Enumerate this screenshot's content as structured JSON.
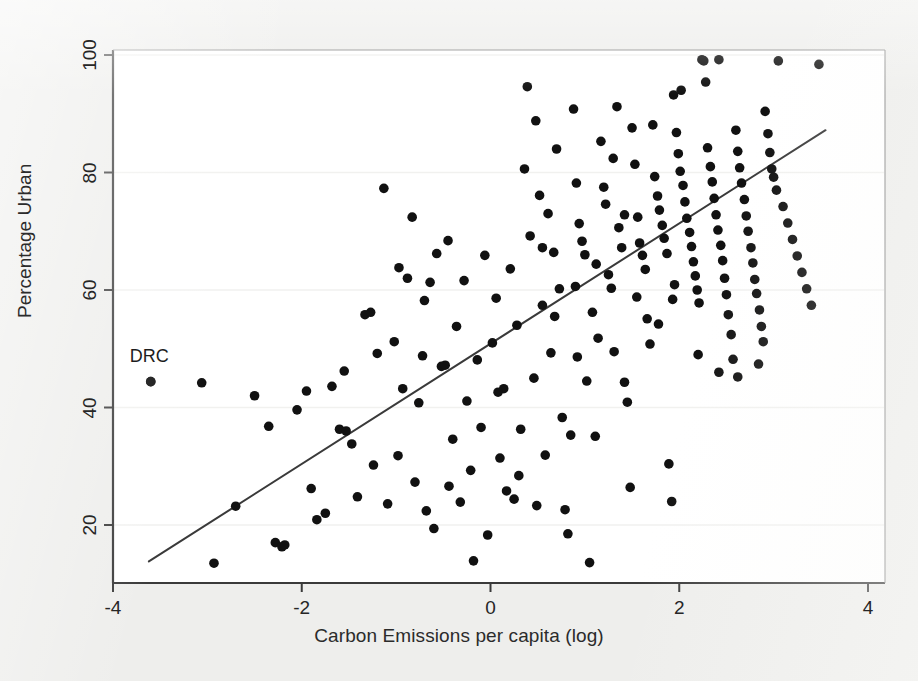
{
  "figure": {
    "background_color": "#eeeeec",
    "plot_background_color": "#ffffff",
    "width": 918,
    "height": 681
  },
  "axes": {
    "x": {
      "title": "Carbon Emissions per capita (log)",
      "ticks": [
        -4,
        -2,
        0,
        2,
        4
      ],
      "tick_labels": [
        "-4",
        "-2",
        "0",
        "2",
        "4"
      ],
      "range": [
        -4.2,
        4.2
      ],
      "pixel_left": 113,
      "pixel_right": 885,
      "px_at_minus4": 113,
      "px_at_plus4": 868
    },
    "y": {
      "title": "Percentage Urban",
      "ticks": [
        20,
        40,
        60,
        80,
        100
      ],
      "tick_labels": [
        "20",
        "40",
        "60",
        "80",
        "100"
      ],
      "range": [
        10,
        104
      ],
      "pixel_top": 50,
      "pixel_bottom": 583,
      "px_at_100": 55,
      "px_at_20": 525
    },
    "grid": "horizontal-faint",
    "grid_color": "#f1f1ef",
    "frame_color": "#3a3a3a"
  },
  "annotations": [
    {
      "text": "DRC",
      "x": -3.6,
      "y": 48.5,
      "point_x": -3.6,
      "point_y": 44.4
    }
  ],
  "marker": {
    "color": "#111111",
    "radius_px": 4.8,
    "shape": "circle"
  },
  "chart_data": {
    "type": "scatter",
    "title": "",
    "subtitle": "",
    "xlabel": "Carbon Emissions per capita (log)",
    "ylabel": "Percentage Urban",
    "xlim": [
      -4.2,
      4.2
    ],
    "ylim": [
      10,
      104
    ],
    "xticks": [
      -4,
      -2,
      0,
      2,
      4
    ],
    "yticks": [
      20,
      40,
      60,
      80,
      100
    ],
    "grid": "horizontal",
    "legend": null,
    "n_points": 186,
    "fit_line": {
      "type": "linear",
      "label": "",
      "x_start": -3.62,
      "y_start": 13.8,
      "x_end": 3.55,
      "y_end": 87.2,
      "slope": 10.24,
      "intercept": 50.86,
      "color": "#3a3a3a",
      "width_px": 2.0
    },
    "points": [
      [
        -3.6,
        44.4
      ],
      [
        -3.06,
        44.2
      ],
      [
        -2.93,
        13.5
      ],
      [
        -2.7,
        23.2
      ],
      [
        -2.5,
        42.0
      ],
      [
        -2.35,
        36.8
      ],
      [
        -2.28,
        17.0
      ],
      [
        -2.21,
        16.3
      ],
      [
        -2.18,
        16.6
      ],
      [
        -1.95,
        42.8
      ],
      [
        -1.9,
        26.2
      ],
      [
        -1.84,
        20.9
      ],
      [
        -1.68,
        43.6
      ],
      [
        -1.6,
        36.3
      ],
      [
        -1.53,
        36.0
      ],
      [
        -1.47,
        33.8
      ],
      [
        -1.41,
        24.8
      ],
      [
        -1.33,
        55.8
      ],
      [
        -1.27,
        56.2
      ],
      [
        -1.24,
        30.2
      ],
      [
        -1.2,
        49.2
      ],
      [
        -1.13,
        77.3
      ],
      [
        -1.09,
        23.6
      ],
      [
        -1.02,
        51.2
      ],
      [
        -0.97,
        63.8
      ],
      [
        -0.93,
        43.2
      ],
      [
        -0.88,
        62.0
      ],
      [
        -0.83,
        72.4
      ],
      [
        -0.8,
        27.3
      ],
      [
        -0.76,
        40.8
      ],
      [
        -0.72,
        48.8
      ],
      [
        -0.68,
        22.4
      ],
      [
        -0.64,
        61.3
      ],
      [
        -0.6,
        19.4
      ],
      [
        -0.57,
        66.2
      ],
      [
        -0.52,
        47.0
      ],
      [
        -0.48,
        47.2
      ],
      [
        -0.44,
        26.6
      ],
      [
        -0.4,
        34.6
      ],
      [
        -0.36,
        53.8
      ],
      [
        -0.32,
        23.9
      ],
      [
        -0.28,
        61.6
      ],
      [
        -0.25,
        41.1
      ],
      [
        -0.21,
        29.3
      ],
      [
        -0.18,
        13.9
      ],
      [
        -0.14,
        48.1
      ],
      [
        -0.1,
        36.6
      ],
      [
        -0.06,
        65.9
      ],
      [
        -0.03,
        18.3
      ],
      [
        0.02,
        51.0
      ],
      [
        0.06,
        58.6
      ],
      [
        0.1,
        31.4
      ],
      [
        0.14,
        43.2
      ],
      [
        0.17,
        25.8
      ],
      [
        0.21,
        63.6
      ],
      [
        0.25,
        24.4
      ],
      [
        0.28,
        54.0
      ],
      [
        0.32,
        36.3
      ],
      [
        0.36,
        80.6
      ],
      [
        0.39,
        94.6
      ],
      [
        0.42,
        69.2
      ],
      [
        0.46,
        45.0
      ],
      [
        0.49,
        23.3
      ],
      [
        0.52,
        76.1
      ],
      [
        0.55,
        57.4
      ],
      [
        0.58,
        31.9
      ],
      [
        0.61,
        73.0
      ],
      [
        0.64,
        49.3
      ],
      [
        0.67,
        66.4
      ],
      [
        0.7,
        84.0
      ],
      [
        0.73,
        60.2
      ],
      [
        0.76,
        38.3
      ],
      [
        0.79,
        22.6
      ],
      [
        0.82,
        18.5
      ],
      [
        0.85,
        35.3
      ],
      [
        0.88,
        90.8
      ],
      [
        0.91,
        78.2
      ],
      [
        0.94,
        71.3
      ],
      [
        0.97,
        68.3
      ],
      [
        1.0,
        66.0
      ],
      [
        1.02,
        44.5
      ],
      [
        1.05,
        13.6
      ],
      [
        1.08,
        56.2
      ],
      [
        1.11,
        35.1
      ],
      [
        1.14,
        51.8
      ],
      [
        1.17,
        85.3
      ],
      [
        1.2,
        77.5
      ],
      [
        1.22,
        74.6
      ],
      [
        1.25,
        62.6
      ],
      [
        1.28,
        60.3
      ],
      [
        1.31,
        49.5
      ],
      [
        1.34,
        91.2
      ],
      [
        1.36,
        70.6
      ],
      [
        1.39,
        67.2
      ],
      [
        1.42,
        44.3
      ],
      [
        1.45,
        40.9
      ],
      [
        1.48,
        26.4
      ],
      [
        1.5,
        87.6
      ],
      [
        1.53,
        81.4
      ],
      [
        1.56,
        72.4
      ],
      [
        1.58,
        68.0
      ],
      [
        1.61,
        65.9
      ],
      [
        1.64,
        63.5
      ],
      [
        1.66,
        55.1
      ],
      [
        1.69,
        50.8
      ],
      [
        1.72,
        88.1
      ],
      [
        1.74,
        79.3
      ],
      [
        1.77,
        76.0
      ],
      [
        1.79,
        73.6
      ],
      [
        1.82,
        71.0
      ],
      [
        1.84,
        68.8
      ],
      [
        1.87,
        66.2
      ],
      [
        1.89,
        30.4
      ],
      [
        1.92,
        24.0
      ],
      [
        1.94,
        93.2
      ],
      [
        1.97,
        86.8
      ],
      [
        1.99,
        83.2
      ],
      [
        2.01,
        80.2
      ],
      [
        2.04,
        77.8
      ],
      [
        2.06,
        75.0
      ],
      [
        2.08,
        72.2
      ],
      [
        2.11,
        69.8
      ],
      [
        2.13,
        67.4
      ],
      [
        2.15,
        64.8
      ],
      [
        2.17,
        62.4
      ],
      [
        2.19,
        60.0
      ],
      [
        2.21,
        57.8
      ],
      [
        2.24,
        99.2
      ],
      [
        2.26,
        99.0
      ],
      [
        2.28,
        95.4
      ],
      [
        2.3,
        84.2
      ],
      [
        2.33,
        81.0
      ],
      [
        2.35,
        78.4
      ],
      [
        2.37,
        75.6
      ],
      [
        2.39,
        72.8
      ],
      [
        2.41,
        70.2
      ],
      [
        2.44,
        67.6
      ],
      [
        2.46,
        65.0
      ],
      [
        2.48,
        62.0
      ],
      [
        2.5,
        59.2
      ],
      [
        2.52,
        55.8
      ],
      [
        2.55,
        52.4
      ],
      [
        2.57,
        48.2
      ],
      [
        2.6,
        87.2
      ],
      [
        2.62,
        83.6
      ],
      [
        2.64,
        80.8
      ],
      [
        2.66,
        78.2
      ],
      [
        2.69,
        75.4
      ],
      [
        2.71,
        72.6
      ],
      [
        2.73,
        70.0
      ],
      [
        2.76,
        67.2
      ],
      [
        2.78,
        64.6
      ],
      [
        2.8,
        61.8
      ],
      [
        2.82,
        59.4
      ],
      [
        2.85,
        56.6
      ],
      [
        2.87,
        53.8
      ],
      [
        2.89,
        51.2
      ],
      [
        2.91,
        90.4
      ],
      [
        2.94,
        86.6
      ],
      [
        2.96,
        83.4
      ],
      [
        2.98,
        80.6
      ],
      [
        3.0,
        79.2
      ],
      [
        3.03,
        77.0
      ],
      [
        3.05,
        99.0
      ],
      [
        3.1,
        74.2
      ],
      [
        3.15,
        71.4
      ],
      [
        3.2,
        68.6
      ],
      [
        3.25,
        65.8
      ],
      [
        3.3,
        63.0
      ],
      [
        3.35,
        60.2
      ],
      [
        3.4,
        57.4
      ],
      [
        3.48,
        98.4
      ],
      [
        -2.05,
        39.6
      ],
      [
        -1.75,
        22.0
      ],
      [
        -1.55,
        46.2
      ],
      [
        -0.98,
        31.8
      ],
      [
        -0.7,
        58.2
      ],
      [
        -0.45,
        68.4
      ],
      [
        0.08,
        42.6
      ],
      [
        0.3,
        28.4
      ],
      [
        0.48,
        88.8
      ],
      [
        0.68,
        55.5
      ],
      [
        0.92,
        48.6
      ],
      [
        1.12,
        64.4
      ],
      [
        1.3,
        82.4
      ],
      [
        1.55,
        58.8
      ],
      [
        1.78,
        54.2
      ],
      [
        2.02,
        94.0
      ],
      [
        2.2,
        49.0
      ],
      [
        2.42,
        46.0
      ],
      [
        2.62,
        45.2
      ],
      [
        2.84,
        47.4
      ],
      [
        1.95,
        60.9
      ],
      [
        1.93,
        58.4
      ],
      [
        2.42,
        99.2
      ],
      [
        0.9,
        60.6
      ],
      [
        1.42,
        72.8
      ],
      [
        0.55,
        67.2
      ]
    ]
  }
}
